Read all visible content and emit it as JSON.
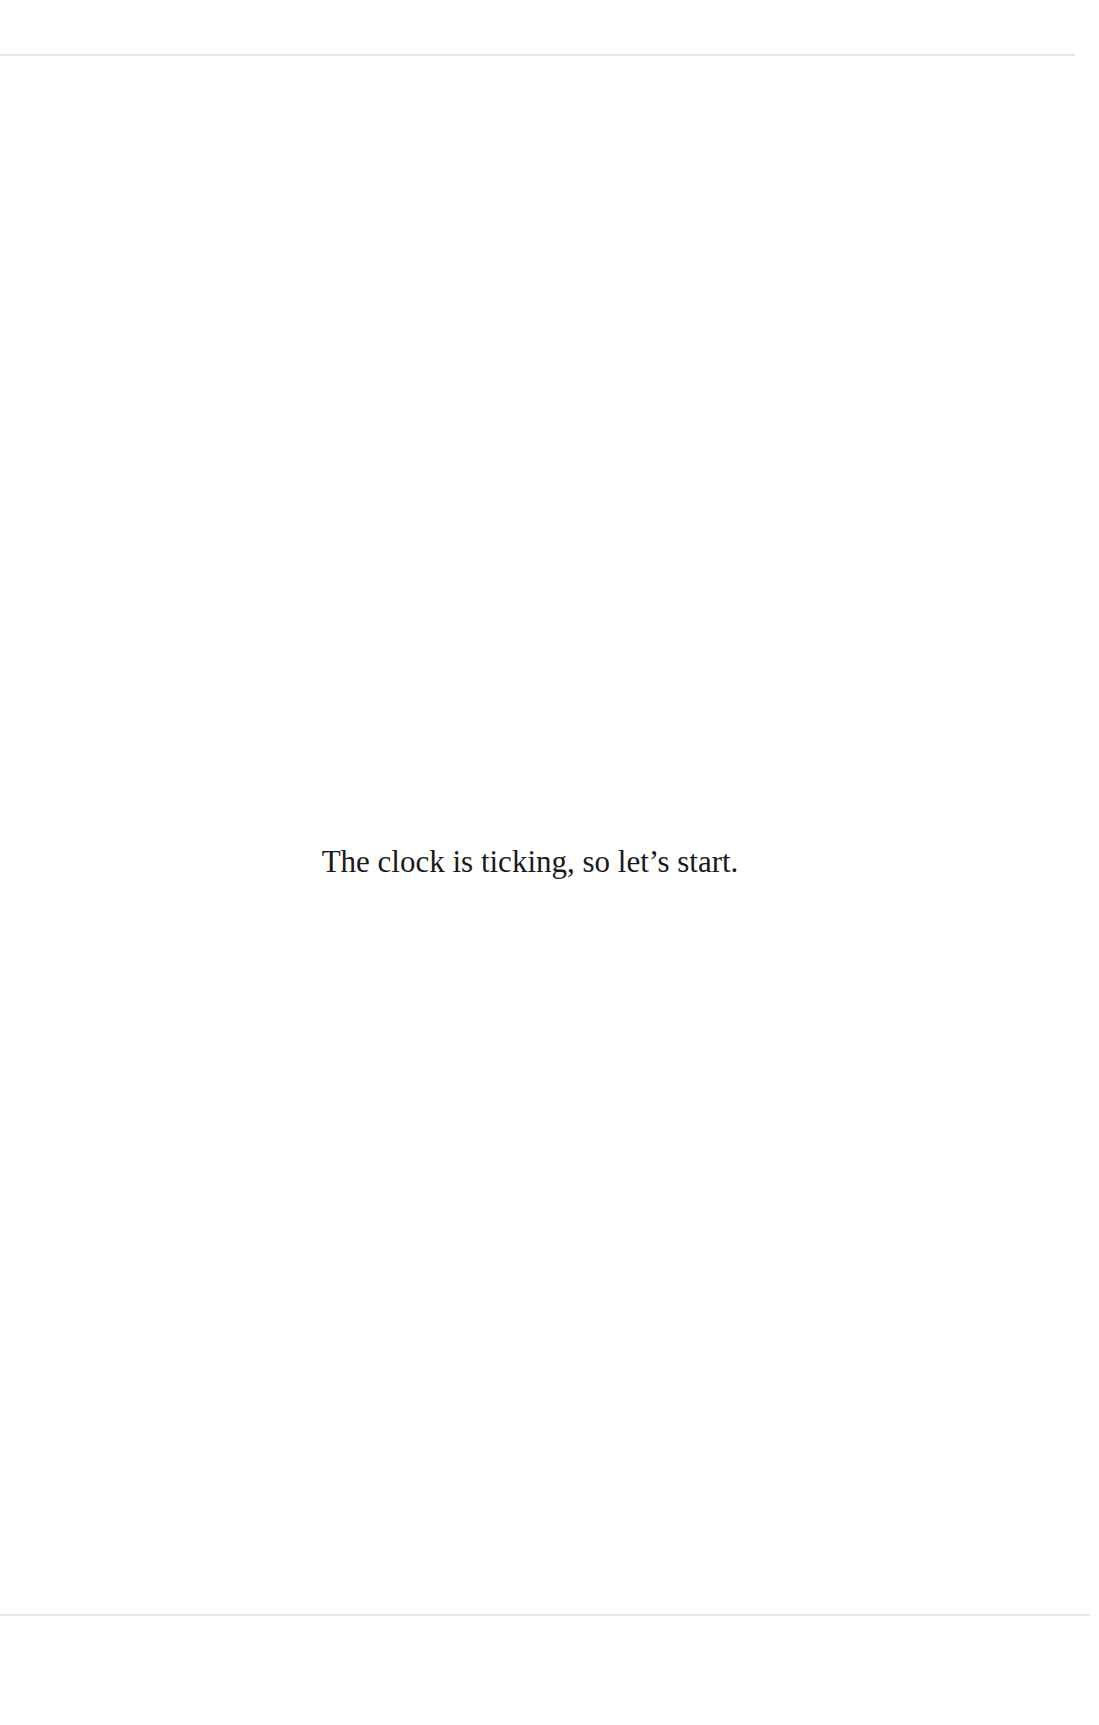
{
  "page": {
    "body_text": "The clock is ticking, so let’s start."
  }
}
